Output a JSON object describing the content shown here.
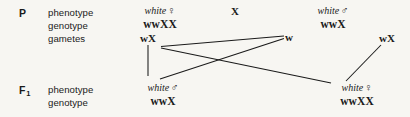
{
  "diagram": {
    "background_color": "#f7f6f2",
    "ink_color": "#1a1a1a"
  },
  "generations": {
    "parental": {
      "label": "P",
      "rows": [
        {
          "name": "phenotype",
          "label": "phenotype"
        },
        {
          "name": "genotype",
          "label": "genotype"
        },
        {
          "name": "gametes",
          "label": "gametes"
        }
      ],
      "cross_symbol": "X",
      "mother": {
        "phenotype": "white",
        "sex_symbol": "♀",
        "genotype": "wwXX",
        "gamete": "wX"
      },
      "father": {
        "phenotype": "white",
        "sex_symbol": "♂",
        "genotype": "wwX",
        "gametes": [
          "w",
          "wX"
        ]
      }
    },
    "f1": {
      "label": "F",
      "subscript": "1",
      "rows": [
        {
          "name": "phenotype",
          "label": "phenotype"
        },
        {
          "name": "genotype",
          "label": "genotype"
        }
      ],
      "son": {
        "phenotype": "white",
        "sex_symbol": "♂",
        "genotype": "wwX"
      },
      "daughter": {
        "phenotype": "white",
        "sex_symbol": "♀",
        "genotype": "wwXX"
      }
    }
  }
}
